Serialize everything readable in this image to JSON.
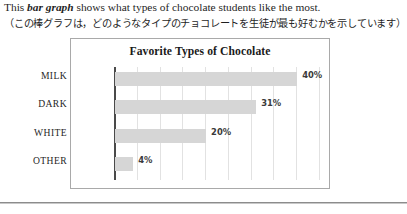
{
  "intro": {
    "english_before": "This ",
    "english_emphasis": "bar graph",
    "english_after": " shows what types of chocolate students like the most.",
    "japanese": "（この棒グラフは，どのようなタイプのチョコレートを生徒が最も好むかを示しています）"
  },
  "figure": {
    "title": "Favorite Types of Chocolate"
  },
  "chart_data": {
    "type": "bar",
    "orientation": "horizontal",
    "title": "Favorite Types of Chocolate",
    "xlabel": "",
    "ylabel": "",
    "categories": [
      "MILK",
      "DARK",
      "WHITE",
      "OTHER"
    ],
    "values": [
      40,
      31,
      20,
      4
    ],
    "value_labels": [
      "40%",
      "31%",
      "20%",
      "4%"
    ],
    "xlim": [
      0,
      45
    ],
    "grid": true,
    "gridline_count": 9,
    "legend": null,
    "bar_color": "#d6d6d6",
    "axis_color": "#4a4a4a"
  }
}
